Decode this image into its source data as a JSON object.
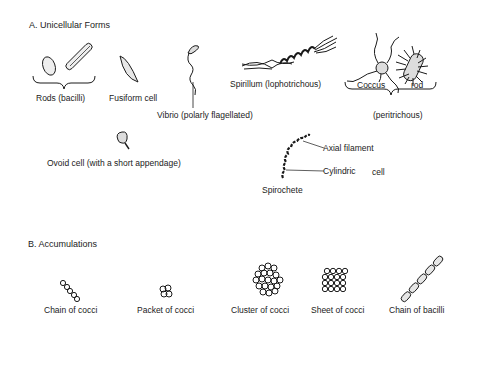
{
  "sections": {
    "unicellular": {
      "heading": "A.  Unicellular Forms",
      "items": {
        "rods": "Rods (bacilli)",
        "fusiform": "Fusiform cell",
        "vibrio": "Vibrio (polarly flagellated)",
        "spirillum": "Spirillum (lophotrichous)",
        "coccus": "Coccus",
        "rod": "rod",
        "peritrichous": "(peritrichous)",
        "ovoid": "Ovoid cell (with a short appendage)",
        "axial_filament": "Axial filament",
        "cylindric": "Cylindric",
        "cell": "cell",
        "spirochete": "Spirochete"
      }
    },
    "accumulations": {
      "heading": "B.  Accumulations",
      "items": {
        "chain_cocci": "Chain of cocci",
        "packet_cocci": "Packet of cocci",
        "cluster_cocci": "Cluster of cocci",
        "sheet_cocci": "Sheet of cocci",
        "chain_bacilli": "Chain of bacilli"
      }
    }
  },
  "colors": {
    "ink": "#1a1a1a",
    "background": "#ffffff"
  }
}
